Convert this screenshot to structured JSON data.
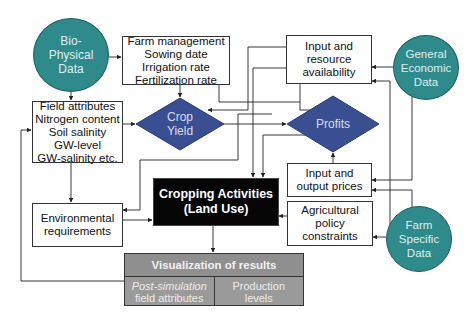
{
  "diagram": {
    "colors": {
      "data_circle": "#2f8a8c",
      "decision_diamond": "#3a4f92",
      "core_box": "#050505",
      "results_block": "#9a9a9a"
    },
    "data_sources": {
      "bio_physical": [
        "Bio-",
        "Physical",
        "Data"
      ],
      "general_economic": [
        "General",
        "Economic",
        "Data"
      ],
      "farm_specific": [
        "Farm",
        "Specific",
        "Data"
      ]
    },
    "boxes": {
      "farm_management": [
        "Farm management",
        "Sowing date",
        "Irrigation rate",
        "Fertilization rate"
      ],
      "input_resource": [
        "Input and",
        "resource",
        "availability"
      ],
      "field_attributes": [
        "Field attributes",
        "Nitrogen content",
        "Soil salinity",
        "GW-level",
        "GW-salinity etc."
      ],
      "input_output_prices": [
        "Input and",
        "output prices"
      ],
      "environmental": [
        "Environmental",
        "requirements"
      ],
      "policy": [
        "Agricultural",
        "policy",
        "constraints"
      ]
    },
    "decisions": {
      "crop_yield": [
        "Crop",
        "Yield"
      ],
      "profits": [
        "Profits"
      ]
    },
    "core": [
      "Cropping Activities",
      "(Land Use)"
    ],
    "results": {
      "title": "Visualization of results",
      "left": [
        "Post-simulation",
        "field attributes"
      ],
      "right": [
        "Production",
        "levels"
      ]
    }
  }
}
